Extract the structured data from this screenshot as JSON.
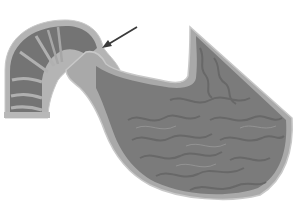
{
  "figure": {
    "width": 298,
    "height": 204,
    "colors": {
      "background": "#ffffff",
      "outer_wall": "#a8a8a8",
      "outer_edge": "#c8c8c8",
      "muscle_layer": "#9a9a9a",
      "mucosa": "#7a7a7a",
      "rugae_folds": "#6a6a6a",
      "fold_highlight": "#9c9c9c",
      "esophagus_rings": "#6e6e6e",
      "arrow": "#3a3a3a"
    },
    "arrow": {
      "from": [
        137,
        27
      ],
      "to": [
        103,
        47
      ]
    }
  }
}
